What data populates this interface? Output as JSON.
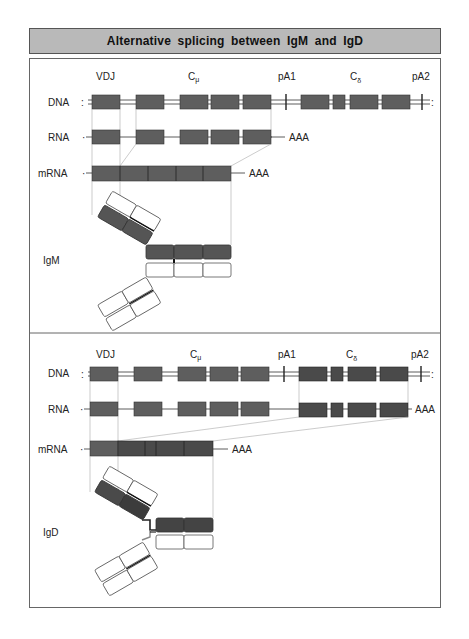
{
  "title": "Alternative splicing between IgM and IgD",
  "colors": {
    "title_band": "#b9b9b9",
    "exon": "#5e5e5e",
    "exon_dark": "#4a4a4a",
    "border": "#555555"
  },
  "panels": [
    {
      "id": "igm",
      "row_labels": {
        "dna": "DNA",
        "rna": "RNA",
        "mrna": "mRNA"
      },
      "gene_labels": {
        "vdj": "VDJ",
        "c_mu": "C",
        "c_mu_sub": "μ",
        "pa1": "pA1",
        "c_delta": "C",
        "c_delta_sub": "δ",
        "pa2": "pA2"
      },
      "rna_tail": "AAA",
      "mrna_tail": "AAA",
      "antibody_label": "IgM"
    },
    {
      "id": "igd",
      "row_labels": {
        "dna": "DNA",
        "rna": "RNA",
        "mrna": "mRNA"
      },
      "gene_labels": {
        "vdj": "VDJ",
        "c_mu": "C",
        "c_mu_sub": "μ",
        "pa1": "pA1",
        "c_delta": "C",
        "c_delta_sub": "δ",
        "pa2": "pA2"
      },
      "rna_tail": "AAA",
      "mrna_tail": "AAA",
      "antibody_label": "IgD"
    }
  ]
}
